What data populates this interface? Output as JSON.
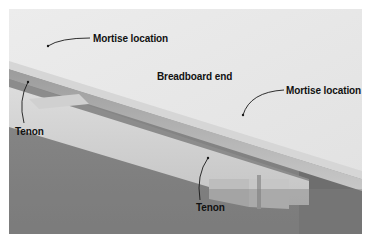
{
  "figure": {
    "labels": [
      {
        "id": "mortise-left",
        "text": "Mortise location"
      },
      {
        "id": "breadboard",
        "text": "Breadboard end"
      },
      {
        "id": "mortise-right",
        "text": "Mortise location"
      },
      {
        "id": "tenon-left",
        "text": "Tenon"
      },
      {
        "id": "tenon-bottom",
        "text": "Tenon"
      }
    ],
    "colors": {
      "label_text": "#111111",
      "leader_line": "#1a1a1a",
      "background": "#ffffff"
    }
  }
}
